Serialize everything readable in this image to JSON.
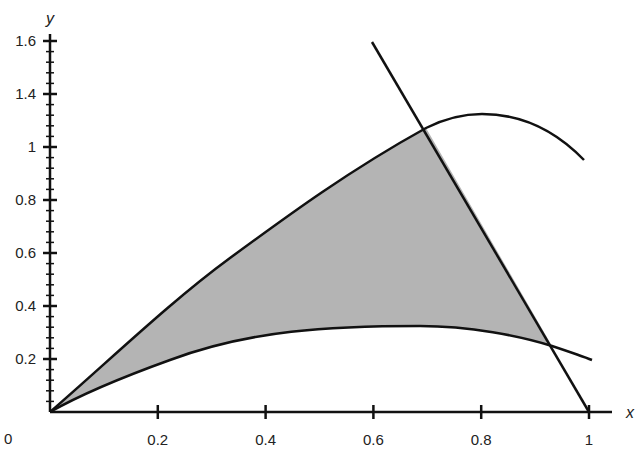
{
  "chart_data": {
    "type": "area",
    "title": "",
    "xlabel": "x",
    "ylabel": "y",
    "origin_label": "0",
    "xlim": [
      0,
      1.05
    ],
    "ylim": [
      0,
      1.6
    ],
    "grid": false,
    "legend": null,
    "x_ticks": [
      {
        "value": 0.2,
        "label": "0.2"
      },
      {
        "value": 0.4,
        "label": "0.4"
      },
      {
        "value": 0.6,
        "label": "0.6"
      },
      {
        "value": 0.8,
        "label": "0.8"
      },
      {
        "value": 1.0,
        "label": "1"
      }
    ],
    "y_ticks": [
      {
        "value": 0.2,
        "label": "0.2"
      },
      {
        "value": 0.4,
        "label": "0.4"
      },
      {
        "value": 0.6,
        "label": "0.6"
      },
      {
        "value": 0.8,
        "label": "0.8"
      },
      {
        "value": 1.0,
        "label": "1"
      },
      {
        "value": 1.2,
        "label": "1.4"
      },
      {
        "value": 1.4,
        "label": "1.6"
      }
    ],
    "y_minor_ticks_per_major": 5,
    "series": [
      {
        "name": "upper curve",
        "x": [
          0,
          0.1,
          0.2,
          0.3,
          0.4,
          0.5,
          0.6,
          0.7,
          0.8,
          0.9,
          1.0
        ],
        "y": [
          0,
          0.2,
          0.34,
          0.5,
          0.66,
          0.82,
          0.95,
          1.07,
          1.12,
          1.08,
          0.94
        ]
      },
      {
        "name": "lower curve",
        "x": [
          0,
          0.1,
          0.2,
          0.3,
          0.4,
          0.5,
          0.6,
          0.7,
          0.8,
          0.9,
          1.0
        ],
        "y": [
          0,
          0.12,
          0.19,
          0.25,
          0.29,
          0.31,
          0.32,
          0.31,
          0.3,
          0.26,
          0.2
        ]
      },
      {
        "name": "line",
        "x": [
          0.6,
          1.0
        ],
        "y": [
          1.4,
          0
        ]
      }
    ],
    "shaded_region": {
      "description": "region bounded by upper curve, lower curve, and line",
      "vertices_approx": [
        [
          0,
          0
        ],
        [
          0.7,
          1.07
        ],
        [
          0.93,
          0.25
        ]
      ],
      "fill": "#b4b4b4"
    }
  }
}
